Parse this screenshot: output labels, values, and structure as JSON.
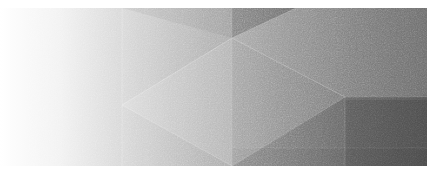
{
  "image": {
    "kind": "abstract-geometric-banner",
    "width": 427,
    "height": 176,
    "alt_text": "Abstract low-poly geometric banner in grayscale",
    "background_color": "#ffffff",
    "content_top": 8,
    "content_bottom": 166,
    "texture": "film-grain"
  },
  "palette": {
    "white": "#ffffff",
    "near_white": "#f7f7f7",
    "light_gray_1": "#e8e8e8",
    "light_gray_2": "#d4d4d4",
    "light_gray_3": "#c2c2c2",
    "mid_gray_1": "#b0b0b0",
    "mid_gray_2": "#a0a0a0",
    "mid_gray_3": "#919191",
    "dark_gray_1": "#7d7d7d",
    "dark_gray_2": "#6e6e6e",
    "dark_gray_3": "#636363",
    "dark_gray_4": "#565656",
    "darkest": "#494949"
  },
  "gradient": {
    "direction": "left-to-right",
    "stops": [
      {
        "offset": "0%",
        "color": "#ffffff"
      },
      {
        "offset": "14%",
        "color": "#f2f2f2"
      },
      {
        "offset": "28%",
        "color": "#d8d8d8"
      },
      {
        "offset": "46%",
        "color": "#b4b4b4"
      },
      {
        "offset": "66%",
        "color": "#8d8d8d"
      },
      {
        "offset": "84%",
        "color": "#6f6f6f"
      },
      {
        "offset": "100%",
        "color": "#5e5e5e"
      }
    ]
  },
  "facets": [
    {
      "name": "base-field",
      "points": "0,8 427,8 427,166 0,166",
      "fill": "gradient",
      "opacity": 1.0
    },
    {
      "name": "left-vertical-band",
      "points": "122,8 232,8 232,166 122,166",
      "fill": "#ffffff",
      "opacity": 0.06
    },
    {
      "name": "left-pointing-triangle",
      "points": "122,105 232,38 232,166",
      "fill": "#ffffff",
      "opacity": 0.13
    },
    {
      "name": "upper-left-wedge",
      "points": "122,8 232,8 232,38",
      "fill": "#000000",
      "opacity": 0.05
    },
    {
      "name": "top-dark-wedge",
      "points": "232,8 296,8 232,38",
      "fill": "#000000",
      "opacity": 0.17
    },
    {
      "name": "upper-right-facet",
      "points": "232,38 296,8 427,8 427,97 345,97",
      "fill": "#ffffff",
      "opacity": 0.09
    },
    {
      "name": "center-fold-facet",
      "points": "232,38 345,97 232,166",
      "fill": "#ffffff",
      "opacity": 0.05
    },
    {
      "name": "lower-right-facet",
      "points": "345,97 427,97 427,166 232,166",
      "fill": "#000000",
      "opacity": 0.1
    },
    {
      "name": "bottom-right-block",
      "points": "345,100 427,100 427,166 345,166",
      "fill": "#000000",
      "opacity": 0.09
    },
    {
      "name": "baseline-strip",
      "points": "232,148 427,148 427,166 232,166",
      "fill": "#000000",
      "opacity": 0.03
    }
  ],
  "edges": [
    {
      "name": "edge-left-vertical",
      "x1": 122,
      "y1": 8,
      "x2": 122,
      "y2": 166,
      "color": "#ffffff",
      "opacity": 0.22,
      "width": 1
    },
    {
      "name": "edge-center-vertical",
      "x1": 232,
      "y1": 8,
      "x2": 232,
      "y2": 166,
      "color": "#ffffff",
      "opacity": 0.1,
      "width": 1
    },
    {
      "name": "edge-triangle-upper",
      "x1": 122,
      "y1": 105,
      "x2": 232,
      "y2": 38,
      "color": "#ffffff",
      "opacity": 0.26,
      "width": 1
    },
    {
      "name": "edge-triangle-lower",
      "x1": 122,
      "y1": 105,
      "x2": 232,
      "y2": 166,
      "color": "#ffffff",
      "opacity": 0.2,
      "width": 1
    },
    {
      "name": "edge-fold-ascending",
      "x1": 232,
      "y1": 38,
      "x2": 345,
      "y2": 97,
      "color": "#ffffff",
      "opacity": 0.24,
      "width": 1
    },
    {
      "name": "edge-fold-descending",
      "x1": 345,
      "y1": 97,
      "x2": 232,
      "y2": 166,
      "color": "#ffffff",
      "opacity": 0.14,
      "width": 1
    },
    {
      "name": "edge-top-wedge-diagonal",
      "x1": 232,
      "y1": 38,
      "x2": 296,
      "y2": 8,
      "color": "#ffffff",
      "opacity": 0.16,
      "width": 1
    },
    {
      "name": "edge-right-vertical",
      "x1": 345,
      "y1": 97,
      "x2": 345,
      "y2": 166,
      "color": "#ffffff",
      "opacity": 0.12,
      "width": 1
    },
    {
      "name": "edge-upper-right-horiz",
      "x1": 345,
      "y1": 97,
      "x2": 427,
      "y2": 97,
      "color": "#ffffff",
      "opacity": 0.08,
      "width": 1
    },
    {
      "name": "edge-baseline-horiz",
      "x1": 232,
      "y1": 148,
      "x2": 427,
      "y2": 148,
      "color": "#ffffff",
      "opacity": 0.07,
      "width": 1
    }
  ]
}
